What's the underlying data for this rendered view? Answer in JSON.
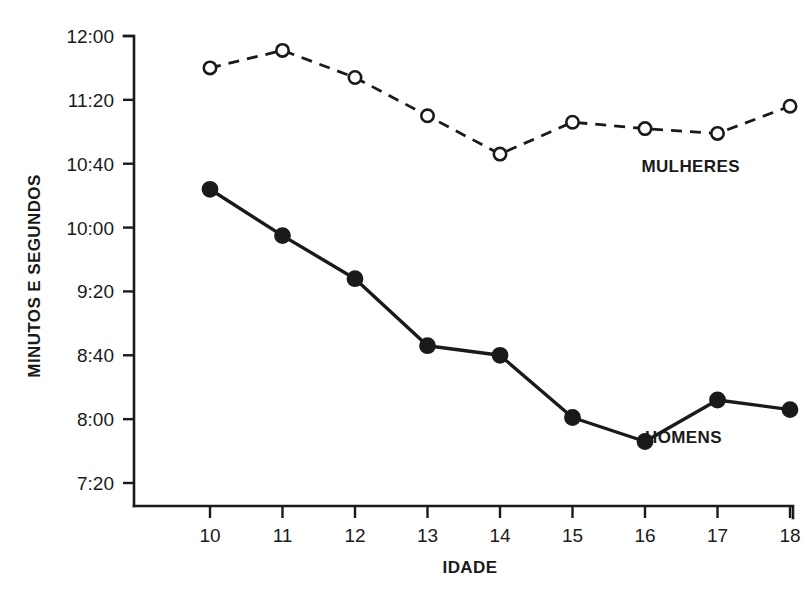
{
  "chart_data": {
    "type": "line",
    "title": "",
    "subtitle": "",
    "xlabel": "IDADE",
    "ylabel": "MINUTOS E SEGUNDOS",
    "x": [
      10,
      11,
      12,
      13,
      14,
      15,
      16,
      17,
      18
    ],
    "xtick_labels": [
      "10",
      "11",
      "12",
      "13",
      "14",
      "15",
      "16",
      "17",
      "18"
    ],
    "ytick_labels": [
      "12:00",
      "11:20",
      "10:40",
      "10:00",
      "9:20",
      "8:40",
      "8:00",
      "7:20"
    ],
    "ytick_seconds": [
      720,
      680,
      640,
      600,
      560,
      520,
      480,
      440
    ],
    "ylim_seconds": [
      432,
      728
    ],
    "xlim": [
      9.55,
      18.0
    ],
    "grid": false,
    "legend_position": "inline-annotation",
    "series": [
      {
        "name": "MULHERES",
        "marker": "open-circle",
        "line_style": "dashed",
        "color": "#1a1a1a",
        "values": [
          "11:40",
          "11:51",
          "11:34",
          "11:10",
          "10:46",
          "11:06",
          "11:02",
          "10:59",
          "11:16"
        ],
        "values_seconds": [
          700,
          711,
          694,
          670,
          646,
          666,
          662,
          659,
          676
        ],
        "label_x": 15.95,
        "label_seconds": 635
      },
      {
        "name": "HOMENS",
        "marker": "filled-circle",
        "line_style": "solid",
        "color": "#1a1a1a",
        "values": [
          "10:24",
          "9:55",
          "9:28",
          "8:46",
          "8:40",
          "8:01",
          "7:46",
          "8:12",
          "8:06"
        ],
        "values_seconds": [
          624,
          595,
          568,
          526,
          520,
          481,
          466,
          492,
          486
        ],
        "label_x": 16.0,
        "label_seconds": 465
      }
    ]
  },
  "axes": {
    "y_title": "MINUTOS E SEGUNDOS",
    "x_title": "IDADE"
  },
  "colors": {
    "ink": "#1a1a1a",
    "background": "#ffffff"
  }
}
